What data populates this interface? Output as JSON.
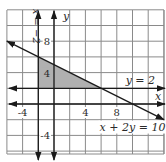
{
  "chart_data": {
    "type": "line",
    "title": "",
    "xlabel": "x",
    "ylabel": "y",
    "xlim": [
      -6,
      14
    ],
    "ylim": [
      -6.5,
      12
    ],
    "grid": true,
    "grid_step": 2,
    "x_ticks": [
      {
        "value": -4,
        "label": "-4"
      },
      {
        "value": 4,
        "label": "4"
      },
      {
        "value": 8,
        "label": "8"
      }
    ],
    "y_ticks": [
      {
        "value": 8,
        "label": "8"
      },
      {
        "value": 4,
        "label": "4"
      },
      {
        "value": -4,
        "label": "-4"
      }
    ],
    "lines": [
      {
        "name": "x-equals-neg-2",
        "label": "x = −2",
        "kind": "vertical",
        "x": -2
      },
      {
        "name": "y-equals-2",
        "label": "y = 2",
        "kind": "horizontal",
        "y": 2
      },
      {
        "name": "x-plus-2y-equals-10",
        "label": "x + 2y = 10",
        "kind": "general",
        "a": 1,
        "b": 2,
        "c": 10
      }
    ],
    "shaded_region": {
      "description": "feasible region",
      "vertices": [
        [
          -2,
          2
        ],
        [
          -2,
          6
        ],
        [
          6,
          2
        ]
      ],
      "color": "#b0b0b0"
    },
    "colors": {
      "grid": "#8a8a8a",
      "lines": "#1a1a1a",
      "shade": "#b0b0b0"
    }
  }
}
